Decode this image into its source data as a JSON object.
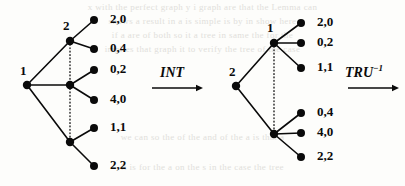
{
  "figure": {
    "background_color": "#fdfdfb",
    "ink_color": "#0a0a0a",
    "ghost_color": "#c9c7c2",
    "ghost_text": [
      "x with the perfect graph  y   i  graph are that the Lemma can",
      "shows a   result in  a   is  simple  is  by in show here",
      "if a  are  of  both  so  it  a  tree  in  same  the  for  the",
      "implies  that  graph  it  to  verify  the  tree  of  the  case"
    ],
    "ghost_text_lower": [
      "we can  so  the  of  the  and  of  the  a  is  that  a",
      "it is  for  the  a   on  the  s  in  the  case  the  tree"
    ]
  },
  "left_tree": {
    "name": "interval-representation-tree",
    "root": {
      "label": "1",
      "x": 27,
      "y": 85
    },
    "internal_nodes": [
      {
        "label": "2",
        "x": 70,
        "y": 41,
        "has_label": true
      },
      {
        "label": "",
        "x": 70,
        "y": 85,
        "has_label": false
      },
      {
        "label": "",
        "x": 70,
        "y": 142,
        "has_label": false
      }
    ],
    "leaves": [
      {
        "label": "2,0",
        "x": 94,
        "y": 20,
        "parent_index": 0
      },
      {
        "label": "0,4",
        "x": 94,
        "y": 49,
        "parent_index": 0
      },
      {
        "label": "0,2",
        "x": 94,
        "y": 70,
        "parent_index": 1
      },
      {
        "label": "4,0",
        "x": 94,
        "y": 100,
        "parent_index": 1
      },
      {
        "label": "1,1",
        "x": 94,
        "y": 128,
        "parent_index": 2
      },
      {
        "label": "2,2",
        "x": 94,
        "y": 166,
        "parent_index": 2
      }
    ],
    "dotted_spine": {
      "x": 70,
      "y_top": 41,
      "y_bottom": 142
    }
  },
  "right_tree": {
    "name": "transformed-tree",
    "root": {
      "label": "2",
      "x": 236,
      "y": 86
    },
    "internal_nodes": [
      {
        "label": "1",
        "x": 274,
        "y": 43,
        "has_label": true
      },
      {
        "label": "",
        "x": 274,
        "y": 134,
        "has_label": false
      }
    ],
    "leaves": [
      {
        "label": "2,0",
        "x": 301,
        "y": 23,
        "parent_index": 0
      },
      {
        "label": "0,2",
        "x": 301,
        "y": 43,
        "parent_index": 0
      },
      {
        "label": "1,1",
        "x": 301,
        "y": 68,
        "parent_index": 0
      },
      {
        "label": "0,4",
        "x": 301,
        "y": 113,
        "parent_index": 1
      },
      {
        "label": "4,0",
        "x": 301,
        "y": 133,
        "parent_index": 1
      },
      {
        "label": "2,2",
        "x": 301,
        "y": 157,
        "parent_index": 1
      }
    ],
    "dotted_spine": {
      "x": 274,
      "y_top": 43,
      "y_bottom": 134
    }
  },
  "arrows": [
    {
      "name": "int-arrow",
      "label": "INT",
      "superscript": "",
      "label_x": 160,
      "label_y": 66,
      "shaft_x1": 152,
      "shaft_x2": 203,
      "shaft_y": 88
    },
    {
      "name": "tru-inverse-arrow",
      "label": "TRU",
      "superscript": "−1",
      "label_x": 345,
      "label_y": 66,
      "shaft_x1": 348,
      "shaft_x2": 399,
      "shaft_y": 88
    }
  ]
}
